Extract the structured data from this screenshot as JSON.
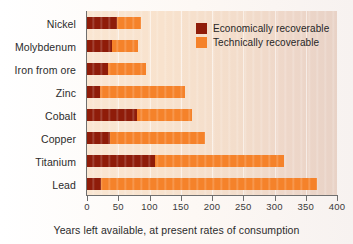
{
  "chart_data": {
    "type": "bar",
    "orientation": "horizontal",
    "stacked": true,
    "title": "",
    "xlabel": "Years left available, at present rates of consumption",
    "ylabel": "",
    "xlim": [
      0,
      400
    ],
    "xticks": [
      0,
      50,
      100,
      150,
      200,
      250,
      300,
      350,
      400
    ],
    "xtick_labels": [
      "0",
      "50",
      "100",
      "150",
      "200",
      "250",
      "300",
      "350",
      "400"
    ],
    "grid": true,
    "legend_position": "top-right",
    "categories": [
      "Nickel",
      "Molybdenum",
      "Iron from ore",
      "Zinc",
      "Cobalt",
      "Copper",
      "Titanium",
      "Lead"
    ],
    "series": [
      {
        "name": "Economically recoverable",
        "color": "#8f1c09",
        "values": [
          48,
          40,
          34,
          20,
          80,
          37,
          108,
          22
        ]
      },
      {
        "name": "Technically recoverable",
        "color": "#f5822a",
        "values": [
          86,
          82,
          95,
          157,
          168,
          188,
          315,
          368
        ]
      }
    ],
    "colors": {
      "economically_recoverable": "#8f1c09",
      "technically_recoverable": "#f5822a",
      "plot_background": "#f6e0cc",
      "axis": "#6f6f6f"
    }
  },
  "legend": {
    "items": [
      {
        "label": "Economically recoverable",
        "color": "#8f1c09"
      },
      {
        "label": "Technically recoverable",
        "color": "#f5822a"
      }
    ]
  },
  "axis": {
    "x_title": "Years left available, at present rates of consumption"
  }
}
